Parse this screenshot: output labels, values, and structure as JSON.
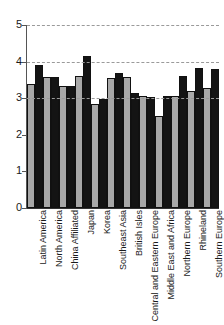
{
  "chart_data": {
    "type": "bar",
    "title": "",
    "subtitle": "",
    "xlabel": "",
    "ylabel": "",
    "ylim": [
      0,
      5
    ],
    "yticks": [
      0,
      1,
      2,
      3,
      4,
      5
    ],
    "ytick_labels": [
      "0",
      "1",
      "2",
      "3",
      "4",
      "5"
    ],
    "grid": true,
    "gridlines_at": [
      3,
      4,
      5
    ],
    "legend": [],
    "legend_position": "none",
    "categories": [
      "Latin America",
      "North America",
      "China Affiliated",
      "Japan",
      "Korea",
      "Southeast Asia",
      "British Isles",
      "Central and Eastern Europe",
      "Middle East and Africa",
      "Northern Europe",
      "Rhineland",
      "Southern Europe"
    ],
    "series": [
      {
        "name": "Series 1",
        "color": "#a8a8a8",
        "values": [
          3.38,
          3.58,
          3.33,
          3.62,
          2.84,
          3.56,
          3.58,
          3.05,
          2.52,
          3.05,
          3.2,
          3.27
        ]
      },
      {
        "name": "Series 2",
        "color": "#141414",
        "values": [
          3.91,
          3.59,
          3.33,
          4.14,
          2.99,
          3.68,
          3.13,
          3.04,
          3.05,
          3.62,
          3.83,
          3.8
        ]
      }
    ]
  }
}
